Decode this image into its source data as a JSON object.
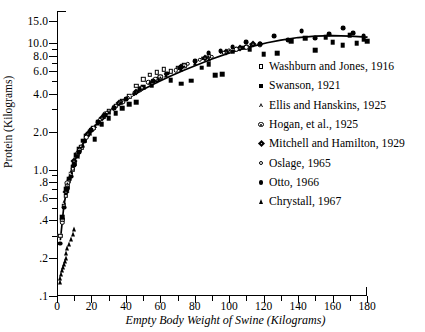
{
  "chart_data": {
    "type": "scatter",
    "title": "",
    "xlabel": "Empty Body Weight of Swine (Kilograms)",
    "ylabel": "Protein (Kilograms)",
    "xlim": [
      0,
      180
    ],
    "ylim": [
      0.1,
      18.0
    ],
    "yscale": "log",
    "xscale": "linear",
    "grid": false,
    "legend_position": "right",
    "xticks": [
      0,
      20,
      40,
      60,
      80,
      100,
      120,
      140,
      160,
      180
    ],
    "xtick_labels": [
      "0",
      "20",
      "40",
      "60",
      "80",
      "100",
      "120",
      "140",
      "160",
      "180"
    ],
    "xminor_ticks": [
      10,
      30,
      50,
      70,
      90,
      110,
      130,
      150,
      170
    ],
    "yticks": [
      0.1,
      0.2,
      0.4,
      0.6,
      0.8,
      1.0,
      2.0,
      4.0,
      6.0,
      8.0,
      10.0,
      15.0
    ],
    "ytick_labels": [
      ".1",
      ".2",
      ".4",
      ".6",
      ".8",
      "1.0",
      "2.0",
      "4.0",
      "6.0",
      "8.0",
      "10.0",
      "15.0"
    ],
    "yminor_ticks": [
      0.3,
      0.5,
      0.7,
      0.9,
      3.0,
      5.0,
      7.0,
      9.0
    ],
    "fit_curve": {
      "name": "fitted allometric curve",
      "x": [
        2,
        4,
        6,
        8,
        10,
        14,
        18,
        22,
        26,
        30,
        36,
        42,
        50,
        58,
        66,
        74,
        82,
        90,
        98,
        106,
        114,
        122,
        130,
        140,
        150,
        160,
        170,
        180
      ],
      "y": [
        0.28,
        0.52,
        0.74,
        0.95,
        1.15,
        1.52,
        1.88,
        2.22,
        2.55,
        2.86,
        3.3,
        3.72,
        4.3,
        4.9,
        5.5,
        6.15,
        6.8,
        7.5,
        8.2,
        8.9,
        9.5,
        10.1,
        10.6,
        11.1,
        11.4,
        11.5,
        11.4,
        11.2
      ]
    },
    "series": [
      {
        "name": "Washburn and Jones, 1916",
        "marker": "open-square",
        "points": [
          [
            2,
            0.3
          ],
          [
            3,
            0.4
          ],
          [
            4,
            0.52
          ],
          [
            5,
            0.62
          ],
          [
            6,
            0.74
          ],
          [
            7,
            0.82
          ],
          [
            8,
            0.92
          ],
          [
            9,
            1.0
          ],
          [
            10,
            1.12
          ],
          [
            12,
            1.32
          ],
          [
            14,
            1.5
          ],
          [
            16,
            1.7
          ],
          [
            18,
            1.9
          ],
          [
            21,
            2.15
          ],
          [
            24,
            2.4
          ],
          [
            27,
            2.65
          ],
          [
            30,
            2.9
          ],
          [
            34,
            3.2
          ],
          [
            38,
            3.5
          ],
          [
            42,
            3.8
          ],
          [
            46,
            4.6
          ],
          [
            50,
            5.2
          ],
          [
            54,
            5.6
          ],
          [
            58,
            5.9
          ],
          [
            62,
            6.2
          ],
          [
            66,
            6.0
          ],
          [
            70,
            6.4
          ],
          [
            74,
            6.7
          ]
        ]
      },
      {
        "name": "Swanson, 1921",
        "marker": "filled-square",
        "points": [
          [
            3,
            0.42
          ],
          [
            5,
            0.7
          ],
          [
            7,
            0.85
          ],
          [
            9,
            1.05
          ],
          [
            11,
            1.3
          ],
          [
            13,
            1.45
          ],
          [
            15,
            1.7
          ],
          [
            17,
            1.85
          ],
          [
            19,
            2.0
          ],
          [
            22,
            1.75
          ],
          [
            26,
            2.3
          ],
          [
            30,
            2.55
          ],
          [
            34,
            2.8
          ],
          [
            38,
            3.05
          ],
          [
            42,
            3.3
          ],
          [
            46,
            3.4
          ],
          [
            50,
            4.5
          ],
          [
            55,
            4.6
          ],
          [
            60,
            5.4
          ],
          [
            66,
            5.1
          ],
          [
            72,
            4.8
          ],
          [
            78,
            5.05
          ],
          [
            84,
            6.4
          ],
          [
            88,
            6.8
          ],
          [
            92,
            5.6
          ],
          [
            96,
            5.7
          ],
          [
            102,
            8.6
          ],
          [
            108,
            9.2
          ],
          [
            112,
            9.0
          ],
          [
            120,
            8.2
          ],
          [
            128,
            8.3
          ],
          [
            136,
            10.4
          ],
          [
            144,
            11.0
          ],
          [
            150,
            8.8
          ],
          [
            156,
            11.2
          ],
          [
            160,
            10.2
          ],
          [
            166,
            9.6
          ],
          [
            170,
            11.6
          ],
          [
            174,
            10.0
          ],
          [
            178,
            10.8
          ],
          [
            180,
            10.4
          ]
        ]
      },
      {
        "name": "Ellis and Hanskins, 1925",
        "marker": "open-triangle",
        "points": [
          [
            4,
            0.55
          ],
          [
            8,
            0.95
          ],
          [
            14,
            1.55
          ],
          [
            22,
            2.2
          ],
          [
            32,
            3.0
          ],
          [
            44,
            3.95
          ],
          [
            56,
            5.05
          ],
          [
            70,
            6.35
          ],
          [
            84,
            7.6
          ],
          [
            96,
            8.5
          ],
          [
            104,
            9.1
          ],
          [
            112,
            9.7
          ]
        ]
      },
      {
        "name": "Hogan, et al., 1925",
        "marker": "circle-dot",
        "points": [
          [
            6,
            0.78
          ],
          [
            12,
            1.35
          ],
          [
            20,
            2.05
          ],
          [
            28,
            2.75
          ],
          [
            38,
            3.45
          ],
          [
            48,
            4.25
          ],
          [
            60,
            5.4
          ],
          [
            74,
            6.6
          ],
          [
            88,
            7.9
          ],
          [
            100,
            8.7
          ],
          [
            110,
            9.4
          ],
          [
            118,
            9.8
          ]
        ]
      },
      {
        "name": "Mitchell and Hamilton, 1929",
        "marker": "filled-diamond",
        "points": [
          [
            5,
            0.66
          ],
          [
            10,
            1.18
          ],
          [
            18,
            1.92
          ],
          [
            26,
            2.58
          ],
          [
            36,
            3.35
          ],
          [
            46,
            4.1
          ],
          [
            58,
            5.15
          ],
          [
            72,
            6.45
          ],
          [
            86,
            7.7
          ],
          [
            98,
            8.6
          ],
          [
            106,
            9.2
          ],
          [
            114,
            9.9
          ]
        ]
      },
      {
        "name": "Oslage, 1965",
        "marker": "open-circle",
        "points": [
          [
            3,
            0.38
          ],
          [
            6,
            0.72
          ],
          [
            9,
            1.02
          ],
          [
            13,
            1.42
          ],
          [
            17,
            1.8
          ],
          [
            21,
            2.12
          ],
          [
            25,
            2.48
          ],
          [
            29,
            2.82
          ],
          [
            33,
            3.15
          ],
          [
            37,
            3.42
          ],
          [
            41,
            3.7
          ],
          [
            45,
            4.05
          ],
          [
            49,
            4.45
          ],
          [
            53,
            4.9
          ],
          [
            57,
            5.25
          ],
          [
            63,
            5.7
          ],
          [
            69,
            6.1
          ],
          [
            76,
            6.85
          ],
          [
            83,
            7.4
          ],
          [
            90,
            7.85
          ],
          [
            97,
            8.45
          ],
          [
            104,
            8.95
          ],
          [
            110,
            9.3
          ]
        ]
      },
      {
        "name": "Otto, 1966",
        "marker": "filled-circle",
        "points": [
          [
            2,
            0.26
          ],
          [
            4,
            0.5
          ],
          [
            6,
            0.7
          ],
          [
            8,
            0.88
          ],
          [
            10,
            1.08
          ],
          [
            13,
            1.38
          ],
          [
            16,
            1.68
          ],
          [
            20,
            2.05
          ],
          [
            24,
            2.38
          ],
          [
            28,
            2.7
          ],
          [
            33,
            3.05
          ],
          [
            40,
            3.6
          ],
          [
            48,
            4.35
          ],
          [
            56,
            5.05
          ],
          [
            64,
            5.75
          ],
          [
            72,
            6.5
          ],
          [
            80,
            7.2
          ],
          [
            88,
            8.4
          ],
          [
            95,
            8.7
          ],
          [
            102,
            9.3
          ],
          [
            110,
            10.2
          ],
          [
            118,
            9.9
          ],
          [
            126,
            11.4
          ],
          [
            134,
            10.6
          ],
          [
            142,
            12.4
          ],
          [
            150,
            11.0
          ],
          [
            158,
            11.8
          ],
          [
            166,
            13.2
          ],
          [
            172,
            12.0
          ],
          [
            178,
            11.5
          ]
        ]
      },
      {
        "name": "Chrystall, 1967",
        "marker": "filled-triangle",
        "points": [
          [
            1.5,
            0.13
          ],
          [
            2,
            0.14
          ],
          [
            2.5,
            0.15
          ],
          [
            3,
            0.16
          ],
          [
            3.5,
            0.17
          ],
          [
            4,
            0.18
          ],
          [
            4.5,
            0.19
          ],
          [
            5,
            0.2
          ],
          [
            5.5,
            0.22
          ],
          [
            6,
            0.24
          ],
          [
            7,
            0.26
          ],
          [
            8,
            0.28
          ],
          [
            9,
            0.31
          ],
          [
            10,
            0.34
          ],
          [
            12,
            1.28
          ],
          [
            15,
            1.58
          ],
          [
            19,
            1.95
          ],
          [
            24,
            2.35
          ],
          [
            30,
            2.85
          ],
          [
            37,
            3.45
          ],
          [
            45,
            4.1
          ],
          [
            54,
            4.9
          ],
          [
            63,
            5.6
          ],
          [
            72,
            6.3
          ],
          [
            80,
            6.95
          ],
          [
            88,
            7.55
          ]
        ]
      }
    ]
  },
  "legend": {
    "items": [
      {
        "label": "Washburn and Jones, 1916",
        "marker": "open-square"
      },
      {
        "label": "Swanson, 1921",
        "marker": "filled-square"
      },
      {
        "label": "Ellis and Hanskins, 1925",
        "marker": "open-triangle"
      },
      {
        "label": "Hogan, et al., 1925",
        "marker": "circle-dot"
      },
      {
        "label": "Mitchell and Hamilton, 1929",
        "marker": "filled-diamond"
      },
      {
        "label": "Oslage, 1965",
        "marker": "open-circle"
      },
      {
        "label": "Otto, 1966",
        "marker": "filled-circle"
      },
      {
        "label": "Chrystall, 1967",
        "marker": "filled-triangle"
      }
    ]
  },
  "colors": {
    "ink": "#000000",
    "background": "#ffffff"
  }
}
